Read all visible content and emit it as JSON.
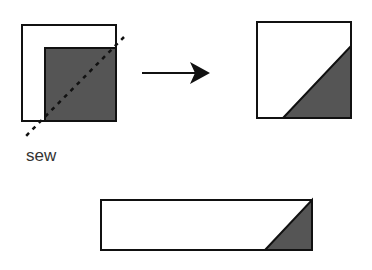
{
  "diagram": {
    "label_sew": "sew",
    "colors": {
      "stroke": "#111111",
      "fill_dark": "#555555",
      "fill_light": "#ffffff"
    },
    "step1": {
      "description": "Two overlapping squares, smaller dark square placed on lower-right corner, dashed diagonal sew line"
    },
    "step2": {
      "description": "Resulting square with dark triangle in lower-right corner"
    },
    "step3": {
      "description": "Long rectangle with dark triangle at right end"
    }
  }
}
